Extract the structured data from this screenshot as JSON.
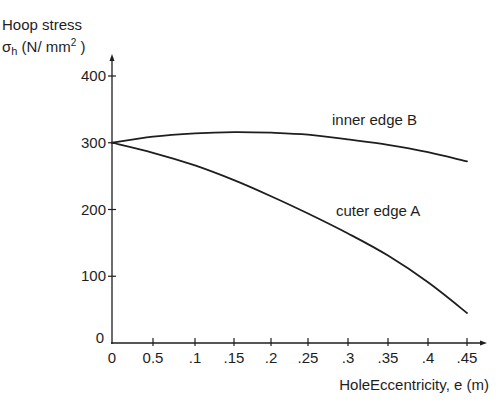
{
  "chart_data": {
    "type": "line",
    "title": "",
    "ylabel_line1": "Hoop stress",
    "ylabel_symbol": "σ",
    "ylabel_subscript": "h",
    "ylabel_units": " (N/ mm",
    "ylabel_sup": "2",
    "ylabel_close": " )",
    "xlabel": "HoleEccentricity, e (m)",
    "xlim": [
      0,
      0.45
    ],
    "ylim": [
      0,
      400
    ],
    "grid": false,
    "legend": "inline labels",
    "x_tick_labels": [
      "0",
      "0.5",
      ".1",
      ".15",
      ".2",
      ".25",
      ".3",
      ".35",
      ".4",
      ".45"
    ],
    "x_tick_values": [
      0,
      0.05,
      0.1,
      0.15,
      0.2,
      0.25,
      0.3,
      0.35,
      0.4,
      0.45
    ],
    "y_tick_labels": [
      "0",
      "100",
      "200",
      "300",
      "400"
    ],
    "y_tick_values": [
      0,
      100,
      200,
      300,
      400
    ],
    "x": [
      0,
      0.05,
      0.1,
      0.15,
      0.2,
      0.25,
      0.3,
      0.35,
      0.4,
      0.45
    ],
    "series": [
      {
        "name": "inner edge B",
        "values": [
          300,
          309,
          314,
          316,
          315,
          312,
          305,
          297,
          286,
          272
        ]
      },
      {
        "name": "cuter edge A",
        "values": [
          300,
          285,
          266,
          244,
          220,
          194,
          164,
          131,
          91,
          45
        ]
      }
    ]
  }
}
